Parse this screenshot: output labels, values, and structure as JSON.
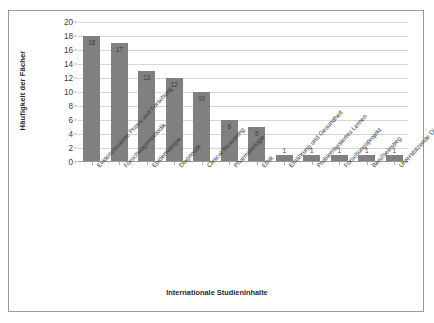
{
  "chart_data": {
    "type": "bar",
    "title": "",
    "xlabel": "Internationale Studieninhalte",
    "ylabel": "Häufigkeit der Fächer",
    "ylim": [
      0,
      20
    ],
    "ytick_step": 2,
    "yticks": [
      0,
      2,
      4,
      6,
      8,
      10,
      12,
      14,
      16,
      18,
      20
    ],
    "grid": true,
    "legend": false,
    "bar_color": "#808080",
    "categories": [
      "Evidenzbasierte Praxis und Forschung",
      "Forschungsmethodik",
      "Epidemiologie",
      "Diagnostik",
      "Clinical Reasoning",
      "Pharmakologie",
      "Ethik",
      "Ernährung und Gesundheit",
      "Problembasiertes Lernen",
      "Forschungsprojekt",
      "Berufseinstieg",
      "Unterstützende Dienstleistung"
    ],
    "values": [
      18,
      17,
      13,
      12,
      10,
      6,
      5,
      1,
      1,
      1,
      1,
      1
    ],
    "data_labels": [
      "18",
      "17",
      "13",
      "12",
      "10",
      "6",
      "5",
      "1",
      "1",
      "1",
      "1",
      "1"
    ]
  }
}
